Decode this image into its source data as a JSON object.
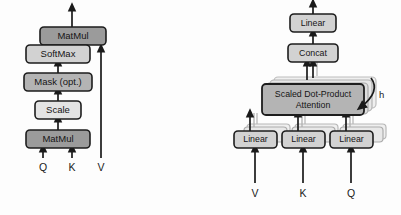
{
  "figure": {
    "background_color": "#fdfdfd",
    "colors": {
      "box_dark_fill": "#9b9b9b",
      "box_mid_fill": "#b4b4b4",
      "box_light_fill": "#d2d2d2",
      "box_pale_fill": "#e4e4e4",
      "box_stroke": "#1d1d1d",
      "ghost_fill": "#efefef",
      "ghost_stroke": "#b8b8b8",
      "arrow_color": "#1a1a1a",
      "text_color": "#151515"
    }
  },
  "left_panel": {
    "name": "Scaled Dot-Product Attention",
    "blocks": [
      {
        "id": "matmul-top",
        "label": "MatMul",
        "shade": "dark"
      },
      {
        "id": "softmax",
        "label": "SoftMax",
        "shade": "light"
      },
      {
        "id": "mask",
        "label": "Mask (opt.)",
        "shade": "mid"
      },
      {
        "id": "scale",
        "label": "Scale",
        "shade": "pale"
      },
      {
        "id": "matmul-bot",
        "label": "MatMul",
        "shade": "dark"
      }
    ],
    "inputs": [
      {
        "id": "q",
        "label": "Q"
      },
      {
        "id": "k",
        "label": "K"
      },
      {
        "id": "v",
        "label": "V"
      }
    ]
  },
  "right_panel": {
    "name": "Multi-Head Attention",
    "blocks": [
      {
        "id": "linear-top",
        "label": "Linear"
      },
      {
        "id": "concat",
        "label": "Concat"
      }
    ],
    "attention_block": {
      "id": "scaled-dot-product-attention",
      "label_line1": "Scaled Dot-Product",
      "label_line2": "Attention",
      "stack_count": 3
    },
    "heads_annotation": {
      "id": "h-label",
      "label": "h"
    },
    "projection_blocks": [
      {
        "id": "linear-v",
        "label": "Linear"
      },
      {
        "id": "linear-k",
        "label": "Linear"
      },
      {
        "id": "linear-q",
        "label": "Linear"
      }
    ],
    "inputs": [
      {
        "id": "v",
        "label": "V"
      },
      {
        "id": "k",
        "label": "K"
      },
      {
        "id": "q",
        "label": "Q"
      }
    ]
  }
}
